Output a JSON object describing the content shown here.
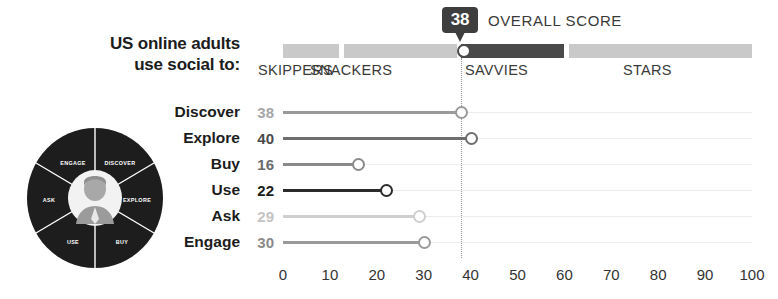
{
  "header": {
    "title_line1": "US online adults",
    "title_line2": "use social to:"
  },
  "overall_score": {
    "value": "38",
    "label": "OVERALL SCORE"
  },
  "segments": [
    {
      "name": "SKIPPERS",
      "start": 0,
      "end": 12,
      "tone": "light",
      "label_x": 258
    },
    {
      "name": "SNACKERS",
      "start": 13,
      "end": 37,
      "tone": "light",
      "label_x": 310
    },
    {
      "name": "SAVVIES",
      "start": 38,
      "end": 60,
      "tone": "dark",
      "label_x": 465
    },
    {
      "name": "STARS",
      "start": 61,
      "end": 100,
      "tone": "light",
      "label_x": 623
    }
  ],
  "reference_value": 38,
  "chart_data": {
    "type": "bar",
    "title": "US online adults use social to:",
    "xlabel": "",
    "ylabel": "",
    "xlim": [
      0,
      100
    ],
    "grid": false,
    "legend": "none",
    "categories": [
      "Discover",
      "Explore",
      "Buy",
      "Use",
      "Ask",
      "Engage"
    ],
    "values": [
      38,
      40,
      16,
      22,
      29,
      30
    ],
    "tick_labels": [
      "0",
      "10",
      "20",
      "30",
      "40",
      "50",
      "60",
      "70",
      "80",
      "90",
      "100"
    ],
    "annotations": [
      "Overall score 38",
      "Dotted reference line at 38"
    ],
    "series": [
      {
        "name": "US online adults use social to",
        "values": [
          38,
          40,
          16,
          22,
          29,
          30
        ]
      }
    ]
  },
  "rows": [
    {
      "label": "Discover",
      "value": "38",
      "num": 38,
      "color": "#9a9a9a",
      "text_color": "#a7a7a7"
    },
    {
      "label": "Explore",
      "value": "40",
      "num": 40,
      "color": "#6e6e6e",
      "text_color": "#4a4a4a"
    },
    {
      "label": "Buy",
      "value": "16",
      "num": 16,
      "color": "#8a8a8a",
      "text_color": "#6a6a6a"
    },
    {
      "label": "Use",
      "value": "22",
      "num": 22,
      "color": "#2b2b2b",
      "text_color": "#1c1c1c"
    },
    {
      "label": "Ask",
      "value": "29",
      "num": 29,
      "color": "#cfcfcf",
      "text_color": "#c4c4c4"
    },
    {
      "label": "Engage",
      "value": "30",
      "num": 30,
      "color": "#9a9a9a",
      "text_color": "#8a8a8a"
    }
  ],
  "axis": {
    "ticks": [
      {
        "label": "0",
        "v": 0
      },
      {
        "label": "10",
        "v": 10
      },
      {
        "label": "20",
        "v": 20
      },
      {
        "label": "30",
        "v": 30
      },
      {
        "label": "40",
        "v": 40
      },
      {
        "label": "50",
        "v": 50
      },
      {
        "label": "60",
        "v": 60
      },
      {
        "label": "70",
        "v": 70
      },
      {
        "label": "80",
        "v": 80
      },
      {
        "label": "90",
        "v": 90
      },
      {
        "label": "100",
        "v": 100
      }
    ]
  },
  "donut": {
    "segments": [
      "DISCOVER",
      "EXPLORE",
      "BUY",
      "USE",
      "ASK",
      "ENGAGE"
    ],
    "center_icon": "person-avatar-icon",
    "ring_color": "#1d1d1d",
    "text_color": "#ffffff"
  },
  "geometry": {
    "plot_left": 283,
    "plot_width": 469
  }
}
